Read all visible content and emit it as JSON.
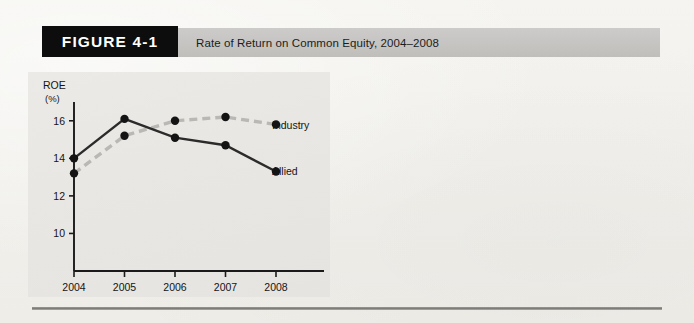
{
  "figure": {
    "badge_label": "FIGURE 4-1",
    "caption": "Rate of Return on Common Equity, 2004–2008"
  },
  "colors": {
    "page_background": "#f3f2ee",
    "header_bar": "#c6c5c3",
    "badge_background": "#0d0d0d",
    "badge_text": "#ffffff",
    "panel_background": "#e9e7e3",
    "allied_line": "#2b2b2b",
    "industry_line": "#b9b8b4",
    "axis": "#1a1a1a",
    "rule": "#8a8986"
  },
  "chart_data": {
    "type": "line",
    "title": "",
    "xlabel": "",
    "ylabel": "ROE\n(%)",
    "ylabel_line1": "ROE",
    "ylabel_line2": "(%)",
    "categories": [
      "2004",
      "2005",
      "2006",
      "2007",
      "2008"
    ],
    "x": [
      2004,
      2005,
      2006,
      2007,
      2008
    ],
    "yticks": [
      10,
      12,
      14,
      16
    ],
    "ytick_labels": [
      "10",
      "12",
      "14",
      "16"
    ],
    "ylim": [
      8.0,
      17.0
    ],
    "grid": false,
    "legend_position": "right-inline",
    "series": [
      {
        "name": "Allied",
        "values": [
          14.0,
          16.1,
          15.1,
          14.7,
          13.3
        ],
        "style": "solid",
        "color": "#2b2b2b",
        "marker": "circle"
      },
      {
        "name": "Industry",
        "values": [
          13.2,
          15.2,
          16.0,
          16.2,
          15.8
        ],
        "style": "dashed",
        "color": "#b9b8b4",
        "marker": "circle"
      }
    ]
  }
}
